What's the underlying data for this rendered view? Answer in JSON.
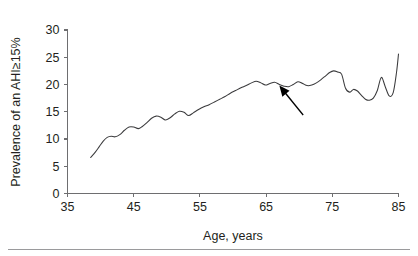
{
  "chart_data": {
    "type": "line",
    "title": "",
    "xlabel": "Age, years",
    "ylabel": "Prevalence of an AHI≥15%",
    "xlim": [
      35,
      85
    ],
    "ylim": [
      0,
      30
    ],
    "xticks": [
      35,
      45,
      55,
      65,
      75,
      85
    ],
    "yticks": [
      0,
      5,
      10,
      15,
      20,
      25,
      30
    ],
    "xtick_labels": [
      "35",
      "45",
      "55",
      "65",
      "75",
      "85"
    ],
    "ytick_labels": [
      "0",
      "5",
      "10",
      "15",
      "20",
      "25",
      "30"
    ],
    "grid": false,
    "legend": false,
    "legend_position": "none",
    "series": [
      {
        "name": "Prevalence of an AHI≥15%",
        "color": "#3b3b3d",
        "x": [
          38.5,
          39.2,
          39.8,
          40.4,
          41.0,
          41.6,
          42.2,
          42.9,
          43.6,
          44.3,
          45.0,
          45.7,
          46.3,
          47.0,
          47.7,
          48.4,
          49.1,
          49.8,
          50.5,
          51.2,
          51.9,
          52.6,
          53.3,
          54.0,
          54.8,
          55.6,
          56.4,
          57.2,
          58.0,
          58.8,
          59.6,
          60.4,
          61.2,
          62.0,
          62.8,
          63.5,
          64.2,
          64.9,
          65.6,
          66.3,
          67.0,
          67.7,
          68.4,
          69.1,
          69.8,
          70.5,
          71.2,
          71.9,
          72.6,
          73.3,
          74.0,
          74.6,
          75.2,
          75.8,
          76.4,
          77.0,
          77.6,
          78.2,
          78.8,
          79.4,
          80.0,
          80.6,
          81.2,
          81.8,
          82.4,
          83.0,
          83.6,
          84.2,
          84.7,
          85.0
        ],
        "y": [
          6.6,
          7.6,
          8.6,
          9.6,
          10.3,
          10.5,
          10.4,
          10.8,
          11.6,
          12.2,
          12.2,
          11.9,
          12.3,
          13.0,
          13.8,
          14.2,
          14.0,
          13.5,
          13.9,
          14.6,
          15.1,
          14.9,
          14.3,
          14.8,
          15.4,
          15.9,
          16.3,
          16.8,
          17.3,
          17.8,
          18.4,
          18.9,
          19.4,
          19.8,
          20.3,
          20.6,
          20.3,
          19.9,
          20.2,
          20.4,
          20.0,
          19.7,
          19.6,
          20.0,
          20.5,
          20.2,
          19.8,
          19.9,
          20.3,
          20.9,
          21.6,
          22.2,
          22.5,
          22.3,
          21.9,
          19.3,
          18.6,
          19.1,
          18.8,
          18.0,
          17.3,
          17.1,
          17.5,
          18.9,
          21.3,
          19.6,
          17.9,
          18.5,
          22.2,
          25.6
        ]
      }
    ],
    "annotations": [
      {
        "name": "pointer-arrow",
        "type": "arrow",
        "text": "",
        "tip_x": 67.0,
        "tip_y": 19.8,
        "tail_x": 70.6,
        "tail_y": 14.4
      }
    ]
  },
  "figure": {
    "axis_color": "#6e6e70",
    "curve_color": "#3b3b3d",
    "text_color": "#231f20",
    "arrow_color": "#000000",
    "rule_color": "#9a9a9c",
    "background": "#ffffff"
  }
}
